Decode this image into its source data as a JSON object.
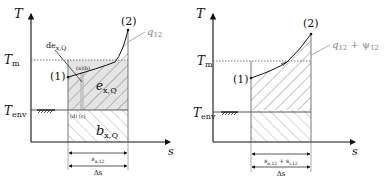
{
  "left_diagram": {
    "axis_y": "T",
    "axis_x": "s",
    "levels": {
      "t_m": "T",
      "t_m_sub": "m",
      "t_env": "T",
      "t_env_sub": "env"
    },
    "points": {
      "p1": "(1)",
      "p2": "(2)"
    },
    "curve_label": "q",
    "curve_label_sub": "12",
    "marker_label": "de",
    "marker_label_sub": "x,Q",
    "small_labels": {
      "top": "(a)(b)",
      "bottom": "(d) (c)"
    },
    "region_exergy": "e",
    "region_exergy_sub": "x,Q",
    "region_anergy": "b",
    "region_anergy_sub": "x,Q",
    "dim_top": "s",
    "dim_top_sub": "a,12",
    "dim_bottom": "Δs"
  },
  "right_diagram": {
    "axis_y": "T",
    "axis_x": "s",
    "levels": {
      "t_m": "T",
      "t_m_sub": "m",
      "t_env": "T",
      "t_env_sub": "env"
    },
    "points": {
      "p1": "(1)",
      "p2": "(2)"
    },
    "curve_label": "q",
    "curve_label_sub": "12",
    "curve_label_plus": " + ψ",
    "curve_label_plus_sub": "12",
    "dim_top": "s",
    "dim_top_sub": "a,12",
    "dim_top_plus": " + s",
    "dim_top_plus_sub": "i,12",
    "dim_bottom": "Δs"
  },
  "colors": {
    "line": "#111111",
    "hatch": "#555555",
    "shade": "#e4e4e4",
    "label_grey": "#888888"
  }
}
